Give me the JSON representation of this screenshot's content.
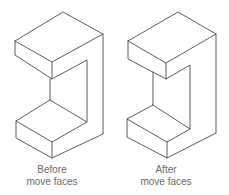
{
  "figure": {
    "panels": [
      {
        "id": "before",
        "caption_line1": "Before",
        "caption_line2": "move faces"
      },
      {
        "id": "after",
        "caption_line1": "After",
        "caption_line2": "move faces"
      }
    ],
    "line_color": "#4a4a4a",
    "text_color": "#6a6a6a"
  }
}
